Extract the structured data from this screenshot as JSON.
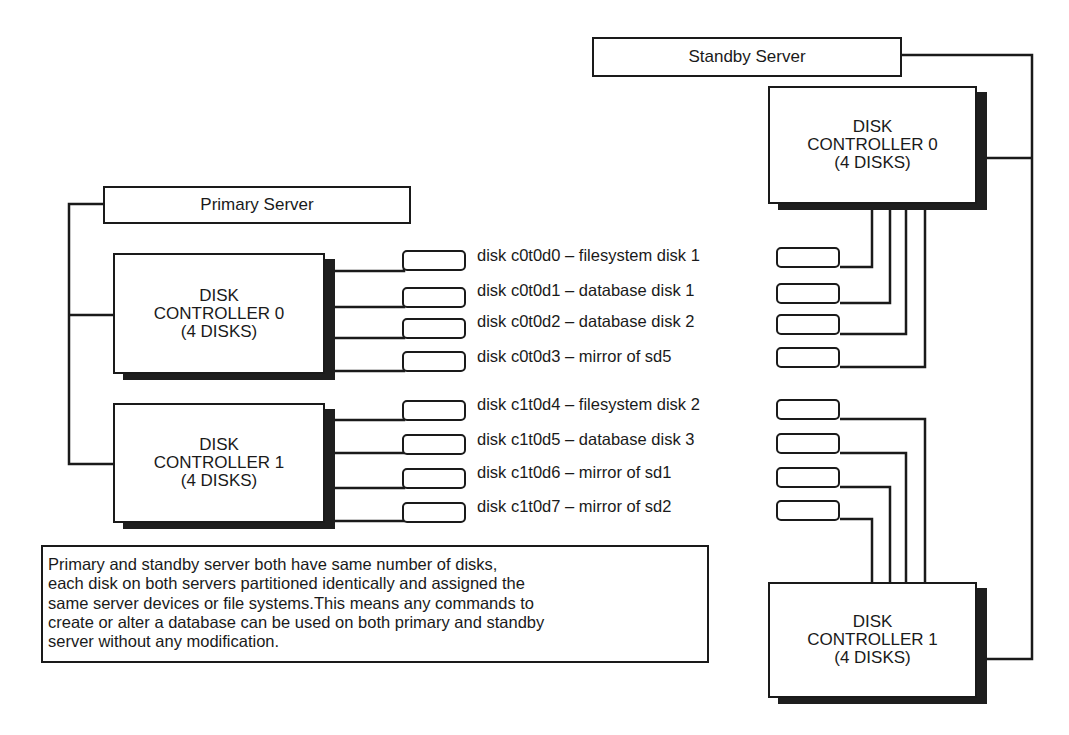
{
  "diagram": {
    "type": "disk-layout",
    "standby_server": {
      "label": "Standby Server",
      "controllers": [
        {
          "line1": "DISK",
          "line2": "CONTROLLER 0",
          "line3": "(4 DISKS)"
        },
        {
          "line1": "DISK",
          "line2": "CONTROLLER 1",
          "line3": "(4 DISKS)"
        }
      ]
    },
    "primary_server": {
      "label": "Primary Server",
      "controllers": [
        {
          "line1": "DISK",
          "line2": "CONTROLLER 0",
          "line3": "(4 DISKS)"
        },
        {
          "line1": "DISK",
          "line2": "CONTROLLER 1",
          "line3": "(4 DISKS)"
        }
      ]
    },
    "disks": [
      {
        "label": "disk c0t0d0 –  filesystem disk 1",
        "controller": 0
      },
      {
        "label": "disk c0t0d1 –  database disk 1",
        "controller": 0
      },
      {
        "label": "disk c0t0d2 –  database disk 2",
        "controller": 0
      },
      {
        "label": "disk c0t0d3 – mirror of sd5",
        "controller": 0
      },
      {
        "label": "disk c1t0d4 –  filesystem disk 2",
        "controller": 1
      },
      {
        "label": "disk c1t0d5 –  database disk 3",
        "controller": 1
      },
      {
        "label": "disk c1t0d6 – mirror of sd1",
        "controller": 1
      },
      {
        "label": "disk c1t0d7 – mirror of sd2",
        "controller": 1
      }
    ],
    "note": {
      "lines": [
        "Primary and standby server both have same number of disks,",
        "each disk on both servers partitioned identically and assigned the",
        "same server devices or file systems.This means any commands to",
        "create or alter a database can be used on both primary and standby",
        "server without any modification."
      ]
    },
    "colors": {
      "line": "#1a1a1a",
      "shadow": "#1e1e1e",
      "background": "#ffffff"
    }
  }
}
